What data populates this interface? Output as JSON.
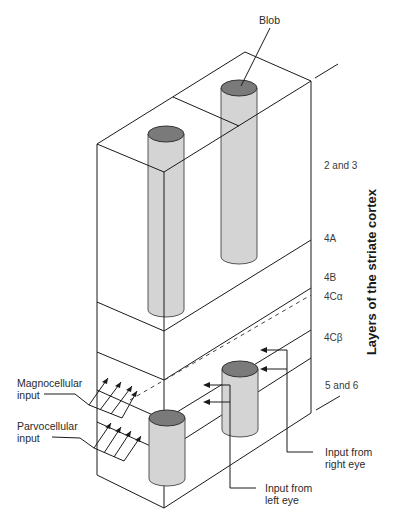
{
  "diagram": {
    "title": "Layers of the striate cortex",
    "callouts": {
      "blob": "Blob",
      "magnocellular": [
        "Magnocellular",
        "input"
      ],
      "parvocellular": [
        "Parvocellular",
        "input"
      ],
      "right_eye": [
        "Input from",
        "right eye"
      ],
      "left_eye": [
        "Input from",
        "left eye"
      ]
    },
    "layers": [
      {
        "id": "2-3",
        "label": "2 and 3"
      },
      {
        "id": "4a",
        "label": "4A"
      },
      {
        "id": "4b",
        "label": "4B"
      },
      {
        "id": "4ca",
        "label": "4Cα"
      },
      {
        "id": "4cb",
        "label": "4Cβ"
      },
      {
        "id": "5-6",
        "label": "5 and 6"
      }
    ],
    "colors": {
      "line": "#1a1a1a",
      "column_fill": "#d4d4d4",
      "column_top": "#7a7a7a"
    }
  }
}
